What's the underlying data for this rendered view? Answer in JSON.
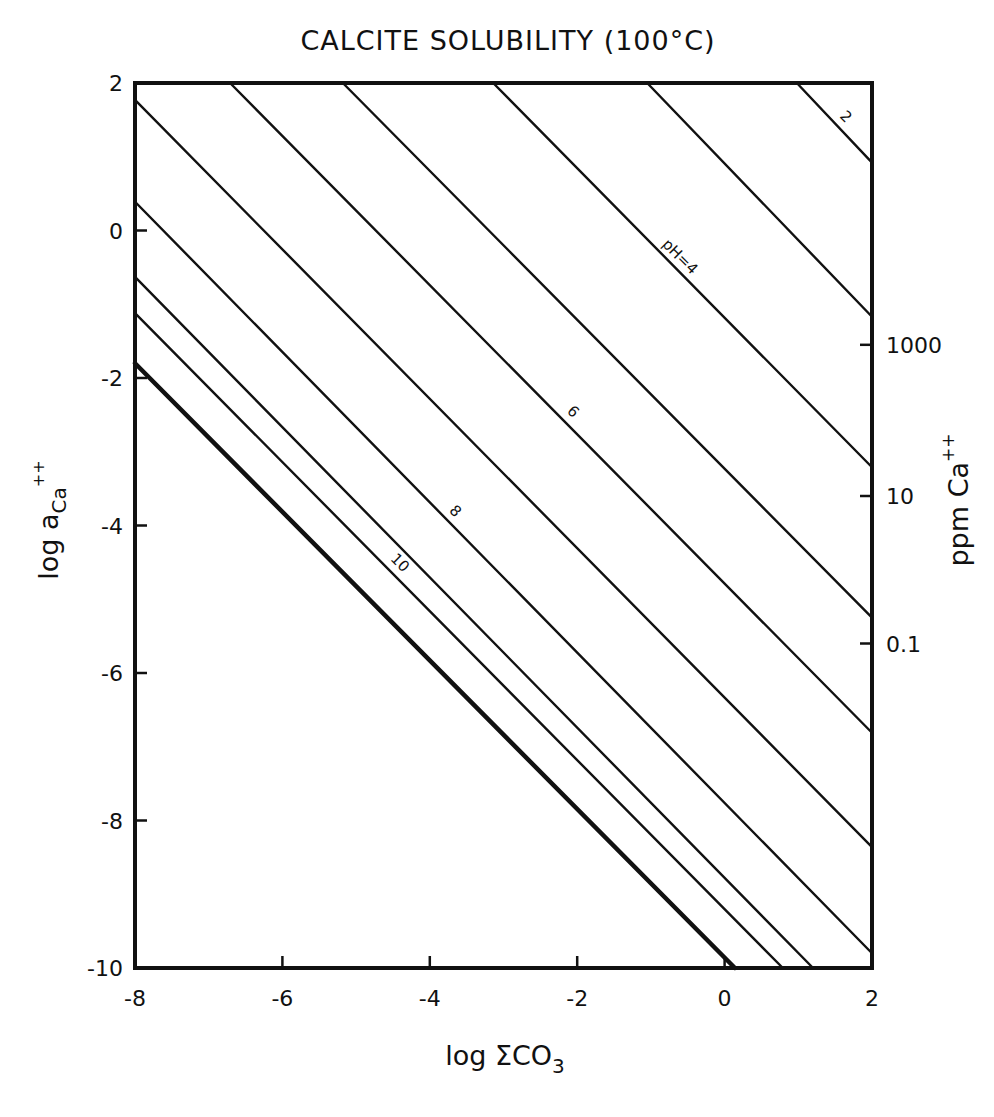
{
  "chart_data": {
    "type": "line",
    "title": "CALCITE SOLUBILITY (100°C)",
    "xlabel": "log ΣCO3",
    "ylabel": "log a_Ca++",
    "y2label": "ppm Ca++",
    "xlim": [
      -8,
      2
    ],
    "ylim": [
      -10,
      2
    ],
    "grid": false,
    "legend": "none (inline line labels)",
    "x_ticks": [
      -8,
      -6,
      -4,
      -2,
      0,
      2
    ],
    "x_tick_labels": [
      "-8",
      "-6",
      "-4",
      "-2",
      "0",
      "2"
    ],
    "y_ticks": [
      2,
      0,
      -2,
      -4,
      -6,
      -8,
      -10
    ],
    "y_tick_labels": [
      "2",
      "0",
      "-2",
      "-4",
      "-6",
      "-8",
      "-10"
    ],
    "y2_ticks": [
      {
        "label": "1000",
        "log_a": -1.55
      },
      {
        "label": "10",
        "log_a": -3.6
      },
      {
        "label": "0.1",
        "log_a": -5.6
      }
    ],
    "series": [
      {
        "name": "pH=2",
        "label": "2",
        "intercept": 2.95,
        "slope": -1,
        "points": [
          [
            0.98,
            2.0
          ],
          [
            2.0,
            0.92
          ]
        ],
        "thick": false
      },
      {
        "name": "pH=3",
        "label": "",
        "intercept": 0.9,
        "slope": -1,
        "points": [
          [
            -1.05,
            2.0
          ],
          [
            2.0,
            -1.17
          ]
        ],
        "thick": false
      },
      {
        "name": "pH=4",
        "label": "pH=4",
        "intercept": -1.17,
        "slope": -1,
        "points": [
          [
            -3.14,
            2.0
          ],
          [
            2.0,
            -3.21
          ]
        ],
        "thick": false
      },
      {
        "name": "pH=5",
        "label": "",
        "intercept": -3.2,
        "slope": -1,
        "points": [
          [
            -5.18,
            2.0
          ],
          [
            2.0,
            -5.25
          ]
        ],
        "thick": false
      },
      {
        "name": "pH=6",
        "label": "6",
        "intercept": -4.76,
        "slope": -1,
        "points": [
          [
            -6.71,
            2.0
          ],
          [
            2.0,
            -6.81
          ]
        ],
        "thick": false
      },
      {
        "name": "pH=7",
        "label": "",
        "intercept": -6.3,
        "slope": -1,
        "points": [
          [
            -8.0,
            1.77
          ],
          [
            2.0,
            -8.36
          ]
        ],
        "thick": false
      },
      {
        "name": "pH=8",
        "label": "8",
        "intercept": -7.7,
        "slope": -1,
        "points": [
          [
            -8.0,
            0.39
          ],
          [
            2.0,
            -9.8
          ]
        ],
        "thick": false
      },
      {
        "name": "pH=9",
        "label": "",
        "intercept": -8.7,
        "slope": -1,
        "points": [
          [
            -8.0,
            -0.63
          ],
          [
            1.2,
            -10.0
          ]
        ],
        "thick": false
      },
      {
        "name": "pH=10",
        "label": "10",
        "intercept": -9.15,
        "slope": -1,
        "points": [
          [
            -8.0,
            -1.12
          ],
          [
            0.79,
            -10.0
          ]
        ],
        "thick": false
      },
      {
        "name": "limit",
        "label": "",
        "intercept": -9.83,
        "slope": -1,
        "points": [
          [
            -8.0,
            -1.8
          ],
          [
            0.14,
            -10.0
          ]
        ],
        "thick": true
      }
    ],
    "annotations": [
      {
        "text": "2",
        "series": "pH=2",
        "x": 1.55,
        "y": 1.45
      },
      {
        "text": "pH=4",
        "series": "pH=4",
        "x": -0.7,
        "y": -0.45
      },
      {
        "text": "6",
        "series": "pH=6",
        "x": -2.15,
        "y": -2.55
      },
      {
        "text": "8",
        "series": "pH=8",
        "x": -3.75,
        "y": -3.9
      },
      {
        "text": "10",
        "series": "pH=10",
        "x": -4.5,
        "y": -4.6
      }
    ]
  },
  "labels": {
    "title": "CALCITE SOLUBILITY (100°C)",
    "xlabel_main": "log ΣCO",
    "xlabel_sub": "3",
    "ylabel_main": "log a",
    "ylabel_sub": "Ca",
    "ylabel_sup": "++",
    "y2label_main": "ppm Ca",
    "y2label_sup": "++"
  }
}
